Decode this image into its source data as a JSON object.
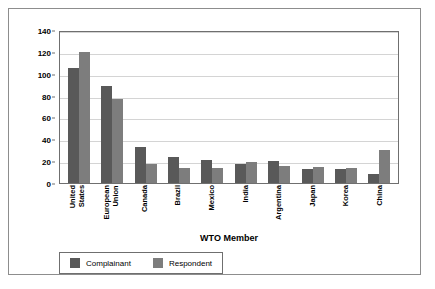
{
  "chart_data": {
    "type": "bar",
    "title": "",
    "xlabel": "WTO Member",
    "ylabel": "Number of Complaints",
    "ylim": [
      0,
      140
    ],
    "ytick_step": 20,
    "yticks": [
      0,
      20,
      40,
      60,
      80,
      100,
      120,
      140
    ],
    "grid": true,
    "legend_position": "bottom-left",
    "categories": [
      "United States",
      "European Union",
      "Canada",
      "Brazil",
      "Mexico",
      "India",
      "Argentina",
      "Japan",
      "Korea",
      "China"
    ],
    "series": [
      {
        "name": "Complainant",
        "color": "#595959",
        "values": [
          105,
          89,
          33,
          24,
          21,
          17,
          20,
          13,
          13,
          8
        ]
      },
      {
        "name": "Respondent",
        "color": "#7d7d7d",
        "values": [
          120,
          77,
          17,
          14,
          14,
          19,
          16,
          15,
          14,
          30
        ]
      }
    ]
  },
  "legend": {
    "items": [
      {
        "label": "Complainant"
      },
      {
        "label": "Respondent"
      }
    ]
  }
}
